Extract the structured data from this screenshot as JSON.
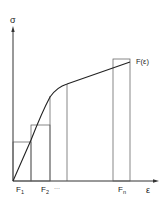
{
  "diagram": {
    "type": "stress-strain-discretization",
    "colors": {
      "axis": "#333333",
      "curve": "#222222",
      "rect": "#555555",
      "text": "#222222",
      "background": "#ffffff"
    },
    "axes": {
      "y_label": "σ",
      "x_label": "ε"
    },
    "curve_label": "F(ε)",
    "x_tick_labels": [
      {
        "main": "F",
        "sub": "1"
      },
      {
        "main": "F",
        "sub": "2"
      },
      {
        "main": "···",
        "sub": ""
      },
      {
        "main": "F",
        "sub": "n"
      }
    ]
  }
}
